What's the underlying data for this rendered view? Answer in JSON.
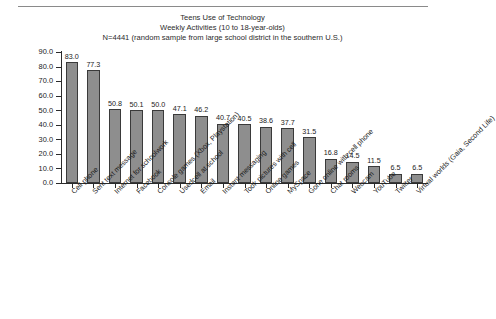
{
  "figure": {
    "title_lines": [
      "Teens Use of Technology",
      "Weekly Activities (10 to 18-year-olds)",
      "N=4441 (random sample from large school district in the southern U.S.)"
    ]
  },
  "chart_data": {
    "type": "bar",
    "title": "Teens Use of Technology Weekly Activities (10 to 18-year-olds) N=4441 (random sample from large school district in the southern U.S.)",
    "xlabel": "",
    "ylabel": "Percent",
    "ylim": [
      0,
      90
    ],
    "yticks": [
      "0.0",
      "10.0",
      "20.0",
      "30.0",
      "40.0",
      "50.0",
      "60.0",
      "70.0",
      "80.0",
      "90.0"
    ],
    "grid": false,
    "legend": "none",
    "bar_color": "#8e8e8e",
    "bar_edge_color": "#3a3a3a",
    "categories": [
      "Cell phone",
      "Sent text message",
      "Internet for schoolwork",
      "Facebook",
      "Console games (Xbox, Playstation)",
      "Usedcell at school",
      "Email",
      "Instant messaging",
      "Took pictures with cell",
      "Online games",
      "MySpace",
      "Gone online with cell phone",
      "Chat rooms",
      "Webcam",
      "YouTube",
      "Twitter",
      "Virtual worlds (Gaia, Second Life)"
    ],
    "values": [
      83.0,
      77.3,
      50.8,
      50.1,
      50.0,
      47.1,
      46.2,
      40.7,
      40.5,
      38.6,
      37.7,
      31.5,
      16.8,
      14.5,
      11.5,
      6.5,
      6.5
    ],
    "value_labels": [
      "83.0",
      "77.3",
      "50.8",
      "50.1",
      "50.0",
      "47.1",
      "46.2",
      "40.7",
      "40.5",
      "38.6",
      "37.7",
      "31.5",
      "16.8",
      "14.5",
      "11.5",
      "6.5",
      "6.5"
    ]
  }
}
